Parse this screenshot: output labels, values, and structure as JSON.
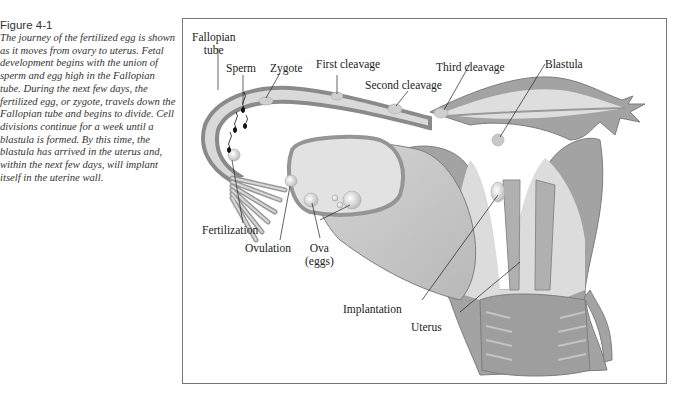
{
  "figure": {
    "label": "Figure 4-1",
    "caption": "The journey of the fertilized egg is shown as it moves from ovary to uterus. Fetal development begins with the union of sperm and egg high in the Fallopian tube. During the next few days, the fertilized egg, or zygote, travels down the Fallopian tube and begins to divide. Cell divisions continue for a week until a blastula is formed. By this time, the blastula has arrived in the uterus and, within the next few days, will implant itself in the uterine wall."
  },
  "diagram": {
    "labels": {
      "fallopian_tube_1": "Fallopian",
      "fallopian_tube_2": "tube",
      "sperm": "Sperm",
      "zygote": "Zygote",
      "first_cleavage": "First cleavage",
      "second_cleavage": "Second cleavage",
      "third_cleavage": "Third cleavage",
      "blastula": "Blastula",
      "fertilization": "Fertilization",
      "ovulation": "Ovulation",
      "ova_1": "Ova",
      "ova_2": "(eggs)",
      "implantation": "Implantation",
      "uterus": "Uterus"
    },
    "colors": {
      "wall": "#9a9a9a",
      "wall_edge": "#7d7d7d",
      "lumen": "#e6e6e6",
      "tissue": "#c9c9c9",
      "cell": "#d8d8d8"
    }
  }
}
